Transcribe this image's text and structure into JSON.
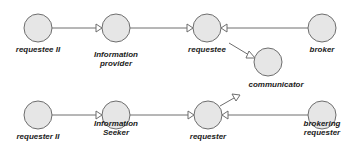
{
  "diagram": {
    "colors": {
      "node_fill": "#e6e6e6",
      "node_stroke": "#6e6e6e",
      "edge": "#6e6e6e",
      "label": "#1a1a1a"
    },
    "nodes": [
      {
        "id": "requestee_ii",
        "label_lines": [
          "requestee II"
        ],
        "cx": 38,
        "cy": 28,
        "r": 14
      },
      {
        "id": "information_provider",
        "label_lines": [
          "Information",
          "provider"
        ],
        "cx": 116,
        "cy": 28,
        "r": 14
      },
      {
        "id": "requestee",
        "label_lines": [
          "requestee"
        ],
        "cx": 207,
        "cy": 28,
        "r": 14
      },
      {
        "id": "broker",
        "label_lines": [
          "broker"
        ],
        "cx": 322,
        "cy": 28,
        "r": 14
      },
      {
        "id": "communicator",
        "label_lines": [
          "communicator"
        ],
        "cx": 268,
        "cy": 62,
        "r": 14
      },
      {
        "id": "requester_ii",
        "label_lines": [
          "requester II"
        ],
        "cx": 38,
        "cy": 115,
        "r": 14
      },
      {
        "id": "information_seeker",
        "label_lines": [
          "Information",
          "Seeker"
        ],
        "cx": 116,
        "cy": 115,
        "r": 14
      },
      {
        "id": "requester",
        "label_lines": [
          "requester"
        ],
        "cx": 208,
        "cy": 115,
        "r": 14
      },
      {
        "id": "brokering_requester",
        "label_lines": [
          "brokering",
          "requester"
        ],
        "cx": 322,
        "cy": 115,
        "r": 14
      }
    ],
    "edges": [
      {
        "from": "requestee_ii",
        "to": "information_provider"
      },
      {
        "from": "information_provider",
        "to": "requestee"
      },
      {
        "from": "broker",
        "to": "requestee"
      },
      {
        "from": "requestee",
        "to": "communicator"
      },
      {
        "from": "requester_ii",
        "to": "information_seeker"
      },
      {
        "from": "information_seeker",
        "to": "requester"
      },
      {
        "from": "brokering_requester",
        "to": "requester"
      },
      {
        "from": "requester",
        "to": "communicator"
      }
    ],
    "labels": {
      "requestee_ii": "requestee II",
      "information_provider_1": "Information",
      "information_provider_2": "provider",
      "requestee": "requestee",
      "broker": "broker",
      "communicator": "communicator",
      "requester_ii": "requester II",
      "information_seeker_1": "Information",
      "information_seeker_2": "Seeker",
      "requester": "requester",
      "brokering_requester_1": "brokering",
      "brokering_requester_2": "requester"
    }
  }
}
